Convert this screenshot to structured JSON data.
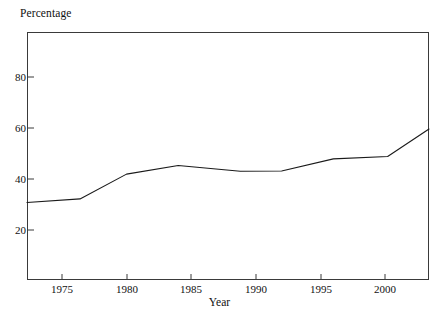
{
  "chart_data": {
    "type": "line",
    "title": "",
    "subtitle": "",
    "xlabel": "Year",
    "ylabel": "Percentage",
    "grid": false,
    "legend": null,
    "legend_position": "none",
    "xlim": [
      1972.3,
      2003.4
    ],
    "ylim": [
      13.0,
      117.0
    ],
    "xticks": [
      1975,
      1980,
      1985,
      1990,
      1995,
      2000
    ],
    "xtick_labels": [
      "1975",
      "1980",
      "1985",
      "1990",
      "1995",
      "2000"
    ],
    "yticks": [
      20,
      40,
      60,
      80
    ],
    "ytick_labels": [
      "20",
      "40",
      "60",
      "80"
    ],
    "line_color": "#1a1a1a",
    "line_width": 1.1,
    "background_color": "#ffffff",
    "frame_color": "#3a3a3a",
    "x": [
      1972.3,
      1976.4,
      1980.0,
      1984.0,
      1988.8,
      1992.0,
      1996.0,
      2000.2,
      2003.4
    ],
    "y": [
      45.5,
      47.0,
      57.4,
      61.0,
      58.6,
      58.7,
      63.8,
      64.8,
      76.3
    ],
    "series": [
      {
        "name": "Percentage",
        "x": [
          1972.3,
          1976.4,
          1980.0,
          1984.0,
          1988.8,
          1992.0,
          1996.0,
          2000.2,
          2003.4
        ],
        "values": [
          45.5,
          47.0,
          57.4,
          61.0,
          58.6,
          58.7,
          63.8,
          64.8,
          76.3
        ]
      }
    ],
    "annotations": []
  },
  "axes": {
    "y_title": "Percentage",
    "x_title": "Year",
    "y_tick_labels": [
      "80",
      "60",
      "40",
      "20"
    ],
    "x_tick_labels": [
      "1975",
      "1980",
      "1985",
      "1990",
      "1995",
      "2000"
    ]
  }
}
